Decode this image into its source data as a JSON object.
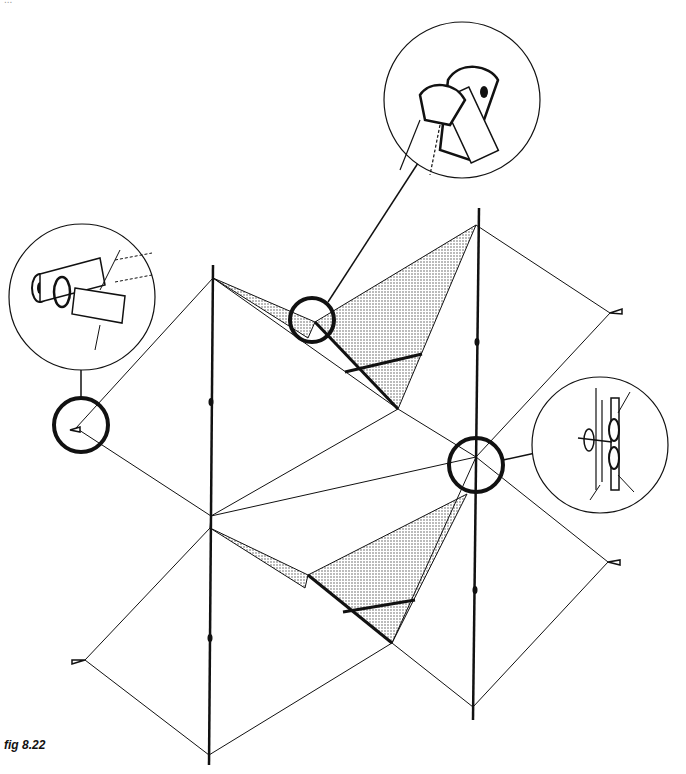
{
  "figure": {
    "caption": "fig 8.22",
    "top_cropped_text": "..."
  },
  "colors": {
    "ink": "#111111",
    "shade": "#bdbdbd",
    "background": "#ffffff"
  },
  "details": [
    {
      "id": "detail-top-right",
      "description": "spar tube connector with sleeve pockets"
    },
    {
      "id": "detail-left",
      "description": "spar end cap with line loop and sail tab"
    },
    {
      "id": "detail-right",
      "description": "line tie at spar junction"
    }
  ]
}
